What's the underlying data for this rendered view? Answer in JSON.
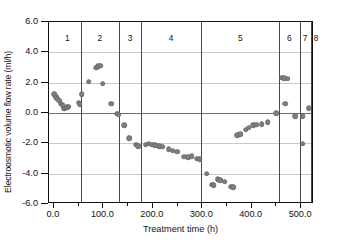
{
  "chart_data": {
    "type": "scatter",
    "title": "",
    "xlabel": "Treatment time (h)",
    "ylabel": "Electroosmotic volume flow rate (ml/h)",
    "xlim": [
      -10,
      526
    ],
    "ylim": [
      -6.0,
      6.0
    ],
    "grid": "horizontal",
    "legend_position": "none",
    "xticks": [
      0.0,
      100.0,
      200.0,
      300.0,
      400.0,
      500.0
    ],
    "xtick_labels": [
      "0.0",
      "100.0",
      "200.0",
      "300.0",
      "400.0",
      "500.0"
    ],
    "yticks": [
      -6.0,
      -4.0,
      -2.0,
      0.0,
      2.0,
      4.0,
      6.0
    ],
    "ytick_labels": [
      "-6.0",
      "-4.0",
      "-2.0",
      "0.0",
      "2.0",
      "4.0",
      "6.0"
    ],
    "marker": {
      "shape": "circle",
      "color": "#7f7f7f",
      "size": 5.6
    },
    "zero_reference_line": 0.0,
    "region_dividers": [
      55,
      132,
      176,
      298,
      455,
      497,
      519
    ],
    "regions": [
      {
        "label": "1",
        "center": 27
      },
      {
        "label": "2",
        "center": 93
      },
      {
        "label": "3",
        "center": 154
      },
      {
        "label": "4",
        "center": 237
      },
      {
        "label": "5",
        "center": 377
      },
      {
        "label": "6",
        "center": 476
      },
      {
        "label": "7",
        "center": 508
      },
      {
        "label": "8",
        "center": 530
      }
    ],
    "points": [
      {
        "x": 1,
        "y": 1.25
      },
      {
        "x": 4,
        "y": 1.05
      },
      {
        "x": 7,
        "y": 0.95
      },
      {
        "x": 11,
        "y": 0.82
      },
      {
        "x": 14,
        "y": 0.62
      },
      {
        "x": 18,
        "y": 0.52
      },
      {
        "x": 21,
        "y": 0.28
      },
      {
        "x": 24,
        "y": 0.35
      },
      {
        "x": 27,
        "y": 0.4
      },
      {
        "x": 30,
        "y": 0.42
      },
      {
        "x": 50,
        "y": 0.68
      },
      {
        "x": 52,
        "y": 0.58
      },
      {
        "x": 56,
        "y": 1.22
      },
      {
        "x": 70,
        "y": 2.07
      },
      {
        "x": 86,
        "y": 2.98
      },
      {
        "x": 90,
        "y": 3.1
      },
      {
        "x": 94,
        "y": 3.12
      },
      {
        "x": 99,
        "y": 1.94
      },
      {
        "x": 116,
        "y": 0.62
      },
      {
        "x": 128,
        "y": -0.05
      },
      {
        "x": 131,
        "y": -0.1
      },
      {
        "x": 142,
        "y": -0.82
      },
      {
        "x": 152,
        "y": -1.65
      },
      {
        "x": 166,
        "y": -2.1
      },
      {
        "x": 170,
        "y": -2.18
      },
      {
        "x": 186,
        "y": -2.1
      },
      {
        "x": 192,
        "y": -2.03
      },
      {
        "x": 199,
        "y": -2.08
      },
      {
        "x": 205,
        "y": -2.12
      },
      {
        "x": 213,
        "y": -2.2
      },
      {
        "x": 219,
        "y": -2.22
      },
      {
        "x": 232,
        "y": -2.4
      },
      {
        "x": 240,
        "y": -2.48
      },
      {
        "x": 249,
        "y": -2.55
      },
      {
        "x": 263,
        "y": -2.88
      },
      {
        "x": 272,
        "y": -2.92
      },
      {
        "x": 279,
        "y": -2.85
      },
      {
        "x": 290,
        "y": -3.02
      },
      {
        "x": 295,
        "y": -3.05
      },
      {
        "x": 309,
        "y": -4.0
      },
      {
        "x": 320,
        "y": -4.72
      },
      {
        "x": 323,
        "y": -4.78
      },
      {
        "x": 331,
        "y": -4.35
      },
      {
        "x": 336,
        "y": -4.42
      },
      {
        "x": 345,
        "y": -4.52
      },
      {
        "x": 358,
        "y": -4.85
      },
      {
        "x": 363,
        "y": -4.9
      },
      {
        "x": 371,
        "y": -1.45
      },
      {
        "x": 377,
        "y": -1.38
      },
      {
        "x": 388,
        "y": -1.1
      },
      {
        "x": 394,
        "y": -0.98
      },
      {
        "x": 403,
        "y": -0.82
      },
      {
        "x": 409,
        "y": -0.78
      },
      {
        "x": 420,
        "y": -0.72
      },
      {
        "x": 432,
        "y": -0.6
      },
      {
        "x": 450,
        "y": 0.0
      },
      {
        "x": 462,
        "y": 2.32
      },
      {
        "x": 466,
        "y": 2.28
      },
      {
        "x": 473,
        "y": 2.25
      },
      {
        "x": 468,
        "y": 0.62
      },
      {
        "x": 488,
        "y": -0.22
      },
      {
        "x": 503,
        "y": -0.2
      },
      {
        "x": 503,
        "y": -2.03
      },
      {
        "x": 515,
        "y": 0.32
      }
    ]
  }
}
